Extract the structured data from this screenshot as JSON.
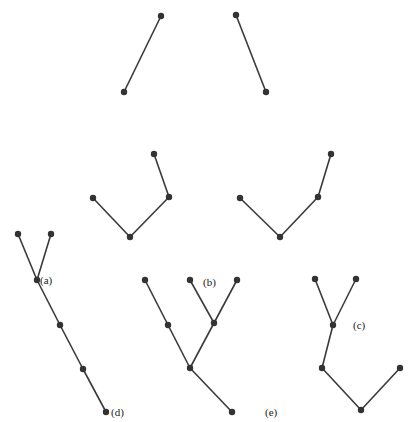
{
  "colors": {
    "edge": "#3a3a3a",
    "node": "#333333",
    "label": "#222222"
  },
  "trees": [
    {
      "id": "top-left",
      "nodes": [
        [
          161,
          16
        ],
        [
          124,
          92
        ]
      ],
      "edges": [
        [
          0,
          1
        ]
      ]
    },
    {
      "id": "top-right",
      "nodes": [
        [
          236,
          15
        ],
        [
          266,
          92
        ]
      ],
      "edges": [
        [
          0,
          1
        ]
      ]
    },
    {
      "id": "middle-left",
      "nodes": [
        [
          93,
          198
        ],
        [
          130,
          237
        ],
        [
          169,
          197
        ],
        [
          154,
          154
        ]
      ],
      "edges": [
        [
          0,
          1
        ],
        [
          1,
          2
        ],
        [
          2,
          3
        ]
      ]
    },
    {
      "id": "middle-right",
      "nodes": [
        [
          240,
          198
        ],
        [
          280,
          237
        ],
        [
          318,
          197
        ],
        [
          331,
          154
        ]
      ],
      "edges": [
        [
          0,
          1
        ],
        [
          1,
          2
        ],
        [
          2,
          3
        ]
      ]
    },
    {
      "id": "bottom-left",
      "nodes": [
        [
          18,
          234
        ],
        [
          51,
          234
        ],
        [
          37,
          280
        ],
        [
          60,
          325
        ],
        [
          83,
          369
        ],
        [
          106,
          412
        ]
      ],
      "edges": [
        [
          0,
          2
        ],
        [
          1,
          2
        ],
        [
          2,
          3
        ],
        [
          3,
          4
        ],
        [
          4,
          5
        ]
      ]
    },
    {
      "id": "bottom-middle",
      "nodes": [
        [
          145,
          280
        ],
        [
          168,
          325
        ],
        [
          190,
          368
        ],
        [
          190,
          280
        ],
        [
          214,
          323
        ],
        [
          237,
          280
        ],
        [
          232,
          412
        ]
      ],
      "edges": [
        [
          0,
          1
        ],
        [
          1,
          2
        ],
        [
          3,
          4
        ],
        [
          5,
          4
        ],
        [
          4,
          2
        ],
        [
          2,
          6
        ]
      ]
    },
    {
      "id": "bottom-right",
      "nodes": [
        [
          315,
          279
        ],
        [
          356,
          279
        ],
        [
          333,
          325
        ],
        [
          322,
          368
        ],
        [
          361,
          410
        ],
        [
          400,
          368
        ]
      ],
      "edges": [
        [
          0,
          2
        ],
        [
          1,
          2
        ],
        [
          2,
          3
        ],
        [
          3,
          4
        ],
        [
          4,
          5
        ]
      ]
    }
  ],
  "labels": [
    {
      "text": "(a)",
      "x": 40,
      "y": 284
    },
    {
      "text": "(b)",
      "x": 203,
      "y": 286
    },
    {
      "text": "(c)",
      "x": 353,
      "y": 329
    },
    {
      "text": "(d)",
      "x": 111,
      "y": 416
    },
    {
      "text": "(e)",
      "x": 265,
      "y": 416
    }
  ]
}
